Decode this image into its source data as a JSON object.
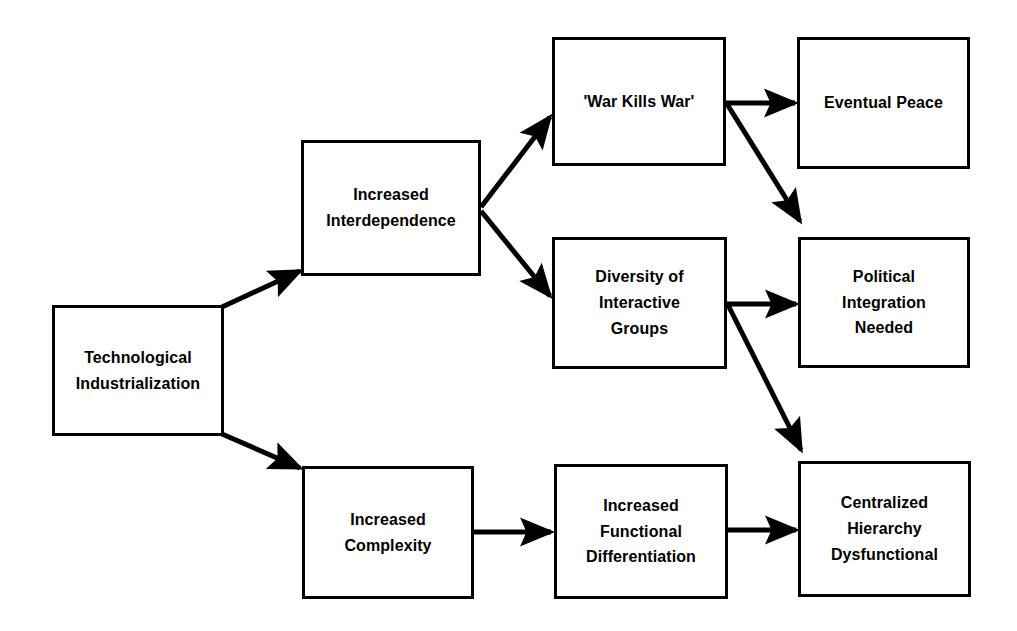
{
  "diagram": {
    "type": "flowchart",
    "background": "#ffffff",
    "line_color": "#000000",
    "text_color": "#000000",
    "nodes": [
      {
        "id": "tech",
        "label": "Technological\nIndustrialization"
      },
      {
        "id": "inter",
        "label": "Increased\nInterdependence"
      },
      {
        "id": "war",
        "label": "'War Kills War'"
      },
      {
        "id": "peace",
        "label": "Eventual Peace"
      },
      {
        "id": "div",
        "label": "Diversity of\nInteractive\nGroups"
      },
      {
        "id": "pol",
        "label": "Political\nIntegration\nNeeded"
      },
      {
        "id": "cplx",
        "label": "Increased\nComplexity"
      },
      {
        "id": "func",
        "label": "Increased\nFunctional\nDifferentiation"
      },
      {
        "id": "cent",
        "label": "Centralized\nHierarchy\nDysfunctional"
      }
    ],
    "edges": [
      {
        "from": "tech",
        "to": "inter",
        "style": "diagonal-up"
      },
      {
        "from": "tech",
        "to": "cplx",
        "style": "diagonal-down"
      },
      {
        "from": "inter",
        "to": "war",
        "style": "diagonal-up"
      },
      {
        "from": "inter",
        "to": "div",
        "style": "diagonal-down"
      },
      {
        "from": "war",
        "to": "peace",
        "style": "horizontal"
      },
      {
        "from": "war",
        "to": "pol",
        "style": "diagonal-down"
      },
      {
        "from": "div",
        "to": "pol",
        "style": "horizontal"
      },
      {
        "from": "div",
        "to": "cent",
        "style": "diagonal-down"
      },
      {
        "from": "cplx",
        "to": "func",
        "style": "horizontal"
      },
      {
        "from": "func",
        "to": "cent",
        "style": "horizontal"
      }
    ]
  }
}
